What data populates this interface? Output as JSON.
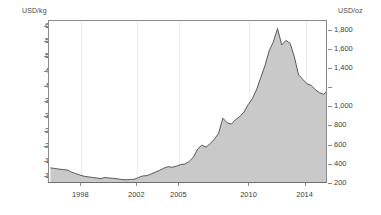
{
  "axes": {
    "left_unit_label": "USD/kg",
    "right_unit_label": "USD/oz"
  },
  "chart_data": {
    "type": "area",
    "title": "",
    "subtitle": "",
    "xlabel": "",
    "ylabel": "USD/kg",
    "y2label": "USD/oz",
    "grid": "vertical-only",
    "legend": "none",
    "xlim": [
      1995.7,
      2015.6
    ],
    "ylim": [
      7500,
      62000
    ],
    "y2lim": [
      200,
      1900
    ],
    "left_axis": {
      "unit": "USD/kg",
      "ticks": [
        10000,
        15000,
        20000,
        25000,
        30000,
        35000,
        40000,
        45000,
        50000,
        55000,
        60000
      ],
      "tick_labels": [
        "10,000",
        "15,000",
        "20,000",
        "25,000",
        "30,000",
        "35,000",
        "40,000",
        "45,000",
        "50,000",
        "55,000",
        "60,000"
      ]
    },
    "right_axis": {
      "unit": "USD/oz",
      "ticks": [
        200,
        400,
        600,
        800,
        1000,
        1200,
        1400,
        1600,
        1800
      ],
      "tick_labels": [
        "200",
        "400",
        "600",
        "800",
        "1,000",
        "",
        "1,400",
        "1,600",
        "1,800"
      ]
    },
    "x_ticks": [
      1998,
      2002,
      2005,
      2010,
      2014
    ],
    "x_tick_labels": [
      "1998",
      "2002",
      "2005",
      "2010",
      "2014"
    ],
    "series": [
      {
        "name": "Gold price",
        "fill_color": "#c9c9c9",
        "line_color": "#4a4a4a",
        "x": [
          1995.8,
          1996.1,
          1996.4,
          1996.7,
          1997.0,
          1997.3,
          1997.6,
          1997.9,
          1998.2,
          1998.5,
          1998.8,
          1999.1,
          1999.4,
          1999.7,
          2000.0,
          2000.3,
          2000.6,
          2000.9,
          2001.2,
          2001.5,
          2001.8,
          2002.1,
          2002.4,
          2002.7,
          2003.0,
          2003.3,
          2003.6,
          2003.9,
          2004.2,
          2004.5,
          2004.8,
          2005.1,
          2005.4,
          2005.7,
          2006.0,
          2006.3,
          2006.6,
          2006.9,
          2007.2,
          2007.5,
          2007.8,
          2008.1,
          2008.4,
          2008.7,
          2009.0,
          2009.3,
          2009.6,
          2009.9,
          2010.2,
          2010.5,
          2010.8,
          2011.1,
          2011.4,
          2011.7,
          2012.0,
          2012.3,
          2012.6,
          2012.9,
          2013.2,
          2013.5,
          2013.8,
          2014.1,
          2014.4,
          2014.7,
          2015.0,
          2015.3,
          2015.5
        ],
        "values": [
          12900,
          12700,
          12500,
          12300,
          12200,
          11500,
          11000,
          10500,
          10100,
          9900,
          9700,
          9500,
          9300,
          9700,
          9500,
          9400,
          9200,
          9000,
          8900,
          9000,
          9100,
          9700,
          10200,
          10300,
          10900,
          11500,
          12100,
          12800,
          13300,
          13100,
          13500,
          14000,
          14200,
          15000,
          16500,
          19200,
          20500,
          19800,
          21000,
          22500,
          24500,
          29500,
          28000,
          27500,
          29000,
          30000,
          31500,
          34000,
          36000,
          39000,
          43000,
          47000,
          52000,
          55000,
          59500,
          54000,
          55500,
          54500,
          50000,
          44000,
          42500,
          41000,
          40500,
          39000,
          38000,
          37500,
          38500
        ]
      }
    ],
    "annotations": []
  }
}
